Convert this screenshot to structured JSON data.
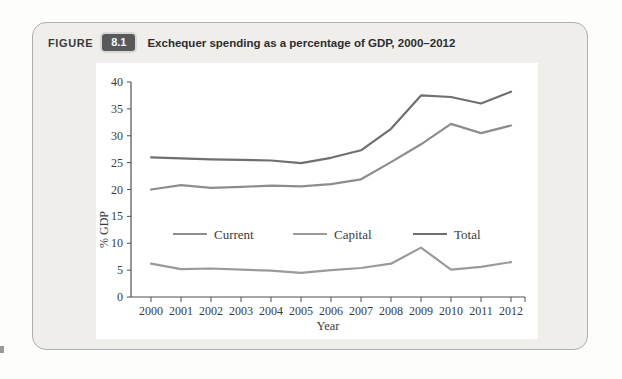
{
  "figure": {
    "label": "FIGURE",
    "number": "8.1",
    "title": "Exchequer spending as a percentage of GDP, 2000–2012"
  },
  "chart_data": {
    "type": "line",
    "title": "",
    "xlabel": "Year",
    "ylabel": "% GDP",
    "ylim": [
      0,
      40
    ],
    "yticks": [
      0,
      5,
      10,
      15,
      20,
      25,
      30,
      35,
      40
    ],
    "grid": false,
    "legend_position": "inside-plot-lower-left",
    "categories": [
      2000,
      2001,
      2002,
      2003,
      2004,
      2005,
      2006,
      2007,
      2008,
      2009,
      2010,
      2011,
      2012
    ],
    "series": [
      {
        "name": "Current",
        "color": "#8d8d8d",
        "values": [
          20.0,
          20.8,
          20.3,
          20.5,
          20.7,
          20.6,
          21.0,
          21.9,
          25.1,
          28.4,
          32.2,
          30.5,
          31.9
        ]
      },
      {
        "name": "Capital",
        "color": "#9a9a9a",
        "values": [
          6.2,
          5.2,
          5.3,
          5.1,
          4.9,
          4.5,
          5.0,
          5.4,
          6.2,
          9.2,
          5.1,
          5.6,
          6.5
        ]
      },
      {
        "name": "Total",
        "color": "#6f6f6f",
        "values": [
          26.0,
          25.8,
          25.6,
          25.5,
          25.4,
          24.9,
          25.9,
          27.3,
          31.3,
          37.5,
          37.2,
          36.0,
          38.2
        ]
      }
    ]
  },
  "colors": {
    "panel_bg": "#efeeeb",
    "panel_border": "#aeaeac",
    "badge_bg": "#58595b",
    "badge_text": "#f7f7f7",
    "header_text": "#2d2d2d",
    "chart_bg": "#ffffff",
    "axis": "#4f4f4f",
    "tick_text": "#3b3b3b"
  }
}
